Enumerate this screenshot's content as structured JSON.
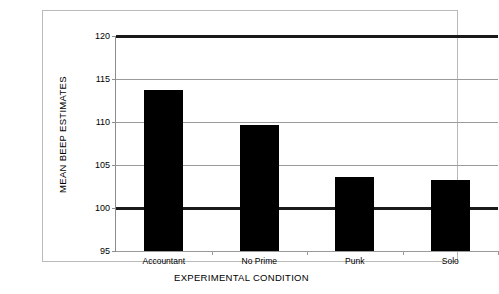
{
  "chart_data": {
    "type": "bar",
    "title": "",
    "subtitle": "",
    "xlabel": "EXPERIMENTAL CONDITION",
    "ylabel": "MEAN BEEP ESTIMATES",
    "categories": [
      "Accountant",
      "No Prime",
      "Punk",
      "Solo"
    ],
    "values": [
      113.7,
      109.7,
      103.6,
      103.3
    ],
    "series": [
      {
        "name": "Mean beep estimates",
        "values": [
          113.7,
          109.7,
          103.6,
          103.3
        ]
      }
    ],
    "ylim": [
      95,
      120
    ],
    "yticks": [
      95,
      100,
      105,
      110,
      115,
      120
    ],
    "ytick_labels": [
      "95",
      "100",
      "105",
      "110",
      "115",
      "120"
    ],
    "emphasized_gridlines": [
      100,
      120
    ],
    "grid": true,
    "legend": "none",
    "bar_color": "#000000",
    "gridline_color": "#9a9a9a",
    "bold_line_color": "#1a1a1a",
    "frame_color": "#b9b9b9",
    "background_color": "#ffffff"
  },
  "axes": {
    "y": {
      "title": "MEAN BEEP ESTIMATES",
      "ticks": [
        {
          "label": "120",
          "value": 120
        },
        {
          "label": "115",
          "value": 115
        },
        {
          "label": "110",
          "value": 110
        },
        {
          "label": "105",
          "value": 105
        },
        {
          "label": "100",
          "value": 100
        },
        {
          "label": "95",
          "value": 95
        }
      ]
    },
    "x": {
      "title": "EXPERIMENTAL CONDITION",
      "categories": [
        {
          "label": "Accountant"
        },
        {
          "label": "No Prime"
        },
        {
          "label": "Punk"
        },
        {
          "label": "Solo"
        }
      ]
    }
  }
}
